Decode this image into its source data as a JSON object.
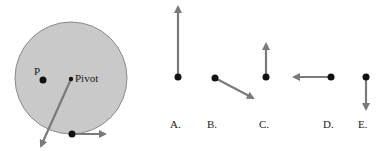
{
  "colors": {
    "background": "#ffffff",
    "disk_fill": "#c9c9c9",
    "disk_stroke": "#8a8a8a",
    "arrow": "#7a7a7a",
    "dot": "#111111",
    "text": "#1a1a1a"
  },
  "disk": {
    "center": [
      71,
      78
    ],
    "radius": 56,
    "points": {
      "p": {
        "label": "P",
        "dot": [
          43,
          80
        ],
        "label_pos": [
          34,
          66
        ]
      },
      "pivot": {
        "label": "Pivot",
        "dot": [
          71,
          79
        ],
        "label_pos": [
          75,
          73
        ]
      },
      "rim": {
        "dot": [
          72,
          134
        ]
      }
    },
    "arrows": [
      {
        "name": "pivot-force-arrow",
        "from": [
          71,
          79
        ],
        "to": [
          41,
          146
        ]
      },
      {
        "name": "rim-tangent-arrow",
        "from": [
          72,
          134
        ],
        "to": [
          105,
          134
        ]
      }
    ]
  },
  "choices": [
    {
      "id": "A",
      "label": "A.",
      "dot": [
        178,
        77
      ],
      "tip": [
        178,
        7
      ],
      "label_pos": [
        170,
        119
      ]
    },
    {
      "id": "B",
      "label": "B.",
      "dot": [
        215,
        78
      ],
      "tip": [
        253,
        98
      ],
      "label_pos": [
        207,
        119
      ]
    },
    {
      "id": "C",
      "label": "C.",
      "dot": [
        266,
        77
      ],
      "tip": [
        266,
        44
      ],
      "label_pos": [
        259,
        119
      ]
    },
    {
      "id": "D",
      "label": "D.",
      "dot": [
        331,
        77
      ],
      "tip": [
        294,
        77
      ],
      "label_pos": [
        323,
        119
      ]
    },
    {
      "id": "E",
      "label": "E.",
      "dot": [
        366,
        77
      ],
      "tip": [
        366,
        109
      ],
      "label_pos": [
        358,
        119
      ]
    }
  ]
}
